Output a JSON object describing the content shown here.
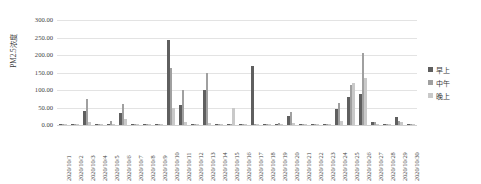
{
  "chart_data": {
    "type": "bar",
    "title": "",
    "xlabel": "",
    "ylabel": "PM2.5浓度",
    "ylim": [
      0,
      300
    ],
    "ytick_labels": [
      "300.00",
      "250.00",
      "200.00",
      "150.00",
      "100.00",
      "50.00",
      "0.00"
    ],
    "ytick_values": [
      300,
      250,
      200,
      150,
      100,
      50,
      0
    ],
    "grid": true,
    "legend_position": "right",
    "categories": [
      "2020/10/1",
      "2020/10/2",
      "2020/10/3",
      "2020/10/4",
      "2020/10/5",
      "2020/10/6",
      "2020/10/7",
      "2020/10/8",
      "2020/10/9",
      "2020/10/10",
      "2020/10/11",
      "2020/10/12",
      "2020/10/13",
      "2020/10/14",
      "2020/10/15",
      "2020/10/16",
      "2020/10/17",
      "2020/10/18",
      "2020/10/19",
      "2020/10/20",
      "2020/10/21",
      "2020/10/22",
      "2020/10/23",
      "2020/10/24",
      "2020/10/25",
      "2020/10/26",
      "2020/10/27",
      "2020/10/28",
      "2020/10/29",
      "2020/10/30"
    ],
    "series": [
      {
        "name": "早上",
        "color": "#5f5f5f",
        "values": [
          3,
          2,
          40,
          3,
          2,
          33,
          2,
          2,
          3,
          243,
          57,
          2,
          100,
          3,
          2,
          2,
          168,
          2,
          3,
          25,
          2,
          2,
          2,
          45,
          80,
          90,
          10,
          2,
          22,
          3
        ]
      },
      {
        "name": "中午",
        "color": "#a0a0a0",
        "values": [
          2,
          2,
          73,
          4,
          12,
          60,
          2,
          2,
          2,
          162,
          100,
          3,
          148,
          2,
          2,
          2,
          3,
          2,
          7,
          38,
          2,
          2,
          2,
          62,
          115,
          205,
          8,
          3,
          12,
          2
        ]
      },
      {
        "name": "晚上",
        "color": "#c9c9c9",
        "values": [
          2,
          2,
          8,
          2,
          3,
          18,
          2,
          2,
          2,
          48,
          8,
          2,
          7,
          2,
          48,
          2,
          2,
          2,
          2,
          5,
          2,
          2,
          3,
          12,
          120,
          135,
          3,
          2,
          10,
          2
        ]
      }
    ]
  },
  "legend": {
    "items": [
      {
        "label": "早上"
      },
      {
        "label": "中午"
      },
      {
        "label": "晚上"
      }
    ]
  }
}
